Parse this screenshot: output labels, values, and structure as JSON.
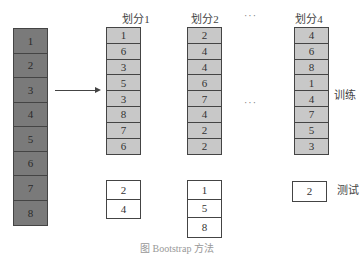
{
  "source_column": {
    "values": [
      "1",
      "2",
      "3",
      "4",
      "5",
      "6",
      "7",
      "8"
    ]
  },
  "partitions": [
    {
      "title": "划分1",
      "train": [
        "1",
        "6",
        "3",
        "5",
        "3",
        "8",
        "7",
        "6"
      ],
      "test": [
        "2",
        "4"
      ]
    },
    {
      "title": "划分2",
      "train": [
        "2",
        "4",
        "4",
        "6",
        "7",
        "4",
        "2",
        "2"
      ],
      "test": [
        "1",
        "5",
        "8"
      ]
    },
    {
      "title": "划分4",
      "train": [
        "4",
        "6",
        "8",
        "1",
        "4",
        "7",
        "5",
        "3"
      ],
      "test": [
        "2"
      ]
    }
  ],
  "ellipsis": "···",
  "labels": {
    "train": "训练",
    "test": "测试"
  },
  "caption": "图 Bootstrap 方法"
}
